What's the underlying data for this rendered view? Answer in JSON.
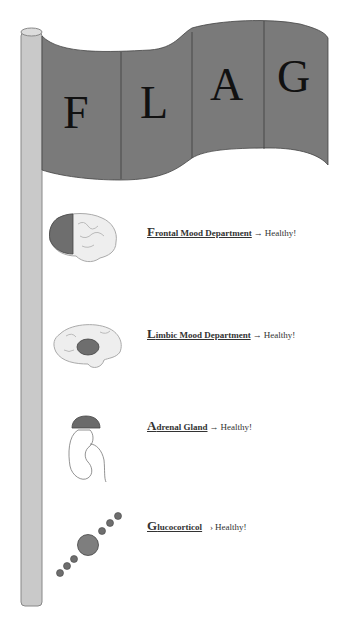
{
  "flag": {
    "letters": [
      "F",
      "L",
      "A",
      "G"
    ],
    "color": "#7a7a7a",
    "pole_color": "#c8c8c8"
  },
  "items": [
    {
      "cap": "F",
      "rest": "rontal Mood Department",
      "arrow": "→",
      "status": "Healthy!",
      "icon": "frontal-brain-icon"
    },
    {
      "cap": "L",
      "rest": "imbic Mood Department",
      "arrow": "→",
      "status": "Healthy!",
      "icon": "limbic-brain-icon"
    },
    {
      "cap": "A",
      "rest": "drenal Gland",
      "arrow": "→",
      "status": "Healthy!",
      "icon": "adrenal-kidney-icon"
    },
    {
      "cap": "G",
      "rest": "lucocorticol",
      "arrow": "›",
      "status": "Healthy!",
      "icon": "glucocorticoid-molecule-icon"
    }
  ]
}
